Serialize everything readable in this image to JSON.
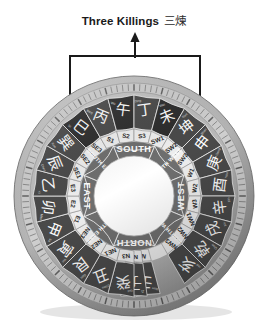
{
  "title": {
    "en": "Three Killings",
    "cn": "三煉"
  },
  "annotation": {
    "arrow_icon": "up-arrow-icon",
    "bracket_icon": "bracket-icon",
    "highlight_icon": "dashed-highlight-icon",
    "highlighted_sectors": [
      "SE3",
      "S2",
      "SW1"
    ],
    "highlight_color": "#c8a55a",
    "bracket_color": "#1a1a1a"
  },
  "compass": {
    "name": "luopan-compass",
    "colors": {
      "rim": "#b9b9b9",
      "rim_dark": "#8e8e8e",
      "ring_chars": "#4a4a4a",
      "ring_chars_dark": "#2d2d2d",
      "ring_sub": "#efefef",
      "ring_dir": "#6f6f6f",
      "text_light": "#ffffff",
      "text_dark": "#2a2a2a",
      "center": "#ffffff"
    },
    "directions": [
      {
        "name": "SOUTH",
        "short": "S",
        "center_deg": 180
      },
      {
        "name": "SOUTH WEST",
        "short": "SW",
        "center_deg": 225
      },
      {
        "name": "WEST",
        "short": "W",
        "center_deg": 270
      },
      {
        "name": "NORTH WEST",
        "short": "NW",
        "center_deg": 315
      },
      {
        "name": "NORTH",
        "short": "N",
        "center_deg": 0
      },
      {
        "name": "NORTH EAST",
        "short": "NE",
        "center_deg": 45
      },
      {
        "name": "EAST",
        "short": "E",
        "center_deg": 90
      },
      {
        "name": "SOUTH EAST",
        "short": "SE",
        "center_deg": 135
      }
    ],
    "mountains": [
      {
        "code": "N1",
        "char": "壬",
        "pinyin": "Ren",
        "deg": 352.5
      },
      {
        "code": "N2",
        "char": "子",
        "pinyin": "Zi",
        "deg": 0
      },
      {
        "code": "N3",
        "char": "癸",
        "pinyin": "Gui",
        "deg": 7.5
      },
      {
        "code": "NE1",
        "char": "丑",
        "pinyin": "Chou",
        "deg": 22.5
      },
      {
        "code": "NE2",
        "char": "艮",
        "pinyin": "Gen",
        "deg": 37.5
      },
      {
        "code": "NE3",
        "char": "寅",
        "pinyin": "Yin",
        "deg": 52.5
      },
      {
        "code": "E1",
        "char": "甲",
        "pinyin": "Jia",
        "deg": 67.5
      },
      {
        "code": "E2",
        "char": "卯",
        "pinyin": "Mao",
        "deg": 82.5
      },
      {
        "code": "E3",
        "char": "乙",
        "pinyin": "Yi",
        "deg": 97.5
      },
      {
        "code": "SE1",
        "char": "辰",
        "pinyin": "Chen",
        "deg": 112.5
      },
      {
        "code": "SE2",
        "char": "巽",
        "pinyin": "Xun",
        "deg": 127.5
      },
      {
        "code": "SE3",
        "char": "巳",
        "pinyin": "Si",
        "deg": 142.5
      },
      {
        "code": "S1",
        "char": "丙",
        "pinyin": "Bing",
        "deg": 157.5
      },
      {
        "code": "S2",
        "char": "午",
        "pinyin": "Wu",
        "deg": 172.5
      },
      {
        "code": "S3",
        "char": "丁",
        "pinyin": "Ding",
        "deg": 187.5
      },
      {
        "code": "SW1",
        "char": "未",
        "pinyin": "Wei",
        "deg": 202.5
      },
      {
        "code": "SW2",
        "char": "坤",
        "pinyin": "Kun",
        "deg": 217.5
      },
      {
        "code": "SW3",
        "char": "申",
        "pinyin": "Shen",
        "deg": 232.5
      },
      {
        "code": "W1",
        "char": "庚",
        "pinyin": "Geng",
        "deg": 247.5
      },
      {
        "code": "W2",
        "char": "酉",
        "pinyin": "You",
        "deg": 262.5
      },
      {
        "code": "W3",
        "char": "辛",
        "pinyin": "Xin",
        "deg": 277.5
      },
      {
        "code": "NW1",
        "char": "戌",
        "pinyin": "Xu",
        "deg": 292.5
      },
      {
        "code": "NW2",
        "char": "乾",
        "pinyin": "Qian",
        "deg": 307.5
      },
      {
        "code": "NW3",
        "char": "亥",
        "pinyin": "Hai",
        "deg": 322.5
      }
    ]
  }
}
